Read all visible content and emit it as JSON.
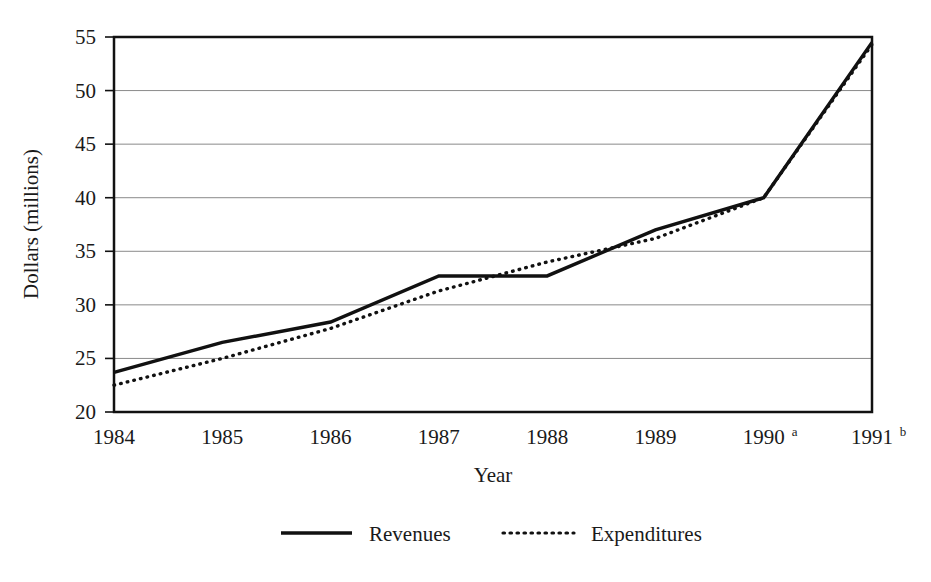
{
  "chart_data": {
    "type": "line",
    "title": "",
    "xlabel": "Year",
    "ylabel": "Dollars (millions)",
    "categories": [
      "1984",
      "1985",
      "1986",
      "1987",
      "1988",
      "1989",
      "1990",
      "1991"
    ],
    "category_superscripts": [
      "",
      "",
      "",
      "",
      "",
      "",
      "a",
      "b"
    ],
    "x": [
      1984,
      1985,
      1986,
      1987,
      1988,
      1989,
      1990,
      1991
    ],
    "ylim": [
      20,
      55
    ],
    "xlim": [
      1984,
      1991
    ],
    "yticks": [
      20,
      25,
      30,
      35,
      40,
      45,
      50,
      55
    ],
    "ytick_labels": [
      "20",
      "25",
      "30",
      "35",
      "40",
      "45",
      "50",
      "55"
    ],
    "grid": true,
    "grid_axis": "y",
    "legend_position": "bottom",
    "series": [
      {
        "name": "Revenues",
        "style": "solid",
        "color": "#111111",
        "values": [
          23.7,
          26.5,
          28.4,
          32.7,
          32.7,
          37.0,
          40.0,
          54.5
        ]
      },
      {
        "name": "Expenditures",
        "style": "dotted",
        "color": "#111111",
        "values": [
          22.5,
          25.0,
          27.8,
          31.3,
          34.0,
          36.2,
          40.0,
          54.3
        ]
      }
    ],
    "annotations": []
  },
  "axis": {
    "y_title": "Dollars (millions)",
    "x_title": "Year",
    "y_ticks": [
      "55",
      "50",
      "45",
      "40",
      "35",
      "30",
      "25",
      "20"
    ],
    "x_ticks": [
      {
        "label": "1984",
        "sup": ""
      },
      {
        "label": "1985",
        "sup": ""
      },
      {
        "label": "1986",
        "sup": ""
      },
      {
        "label": "1987",
        "sup": ""
      },
      {
        "label": "1988",
        "sup": ""
      },
      {
        "label": "1989",
        "sup": ""
      },
      {
        "label": "1990",
        "sup": "a"
      },
      {
        "label": "1991",
        "sup": "b"
      }
    ]
  },
  "legend": {
    "items": [
      {
        "label": "Revenues",
        "style": "solid"
      },
      {
        "label": "Expenditures",
        "style": "dotted"
      }
    ]
  },
  "colors": {
    "line": "#111111",
    "grid": "#8a8a8a",
    "frame": "#111111",
    "background": "#ffffff"
  }
}
